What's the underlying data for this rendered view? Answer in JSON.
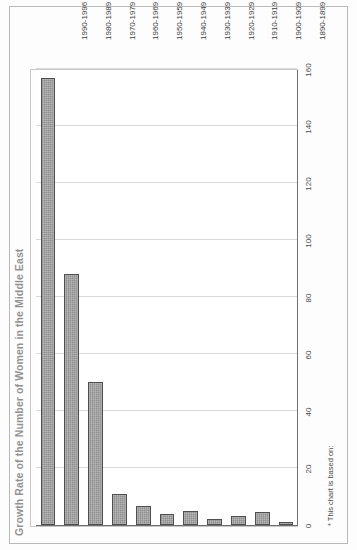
{
  "document": {
    "title": "Growth Rate of the Number of Women in the Middle East",
    "footnote": "* This chart is based on:"
  },
  "chart_data": {
    "type": "bar",
    "orientation": "horizontal",
    "title": "Growth Rate of the Number of Women in the Middle East",
    "xlabel": "",
    "ylabel": "",
    "grid": true,
    "legend": false,
    "xlim": [
      0,
      160
    ],
    "xticks": [
      "0",
      "20",
      "40",
      "60",
      "80",
      "100",
      "120",
      "140",
      "160"
    ],
    "xtick_values": [
      0,
      20,
      40,
      60,
      80,
      100,
      120,
      140,
      160
    ],
    "categories": [
      "1890-1899",
      "1900-1909",
      "1910-1919",
      "1920-1929",
      "1930-1939",
      "1940-1949",
      "1950-1959",
      "1960-1969",
      "1970-1979",
      "1980-1989",
      "1990-1996"
    ],
    "values": [
      1,
      4.5,
      3,
      2,
      5,
      4,
      6.5,
      11,
      50,
      88,
      157
    ]
  }
}
